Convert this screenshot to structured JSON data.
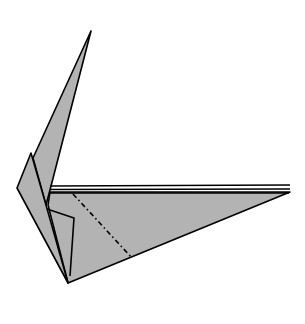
{
  "diagram": {
    "type": "origami-fold-step",
    "paper_color": "#b3b3b3",
    "line_color": "#000000",
    "background": "#ffffff",
    "fold_lines": [
      {
        "kind": "mountain-fold",
        "style": "dash-dot",
        "from": [
          73,
          194
        ],
        "to": [
          132,
          258
        ]
      }
    ]
  }
}
